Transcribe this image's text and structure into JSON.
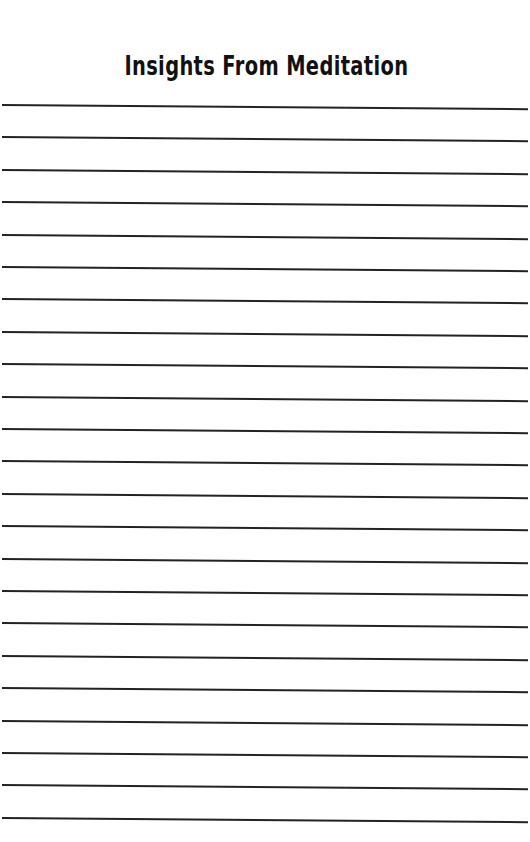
{
  "page": {
    "title": "Insights From Meditation",
    "line_count": 23,
    "first_line_y": 104,
    "line_spacing": 32.4,
    "line_color": "#222222"
  }
}
